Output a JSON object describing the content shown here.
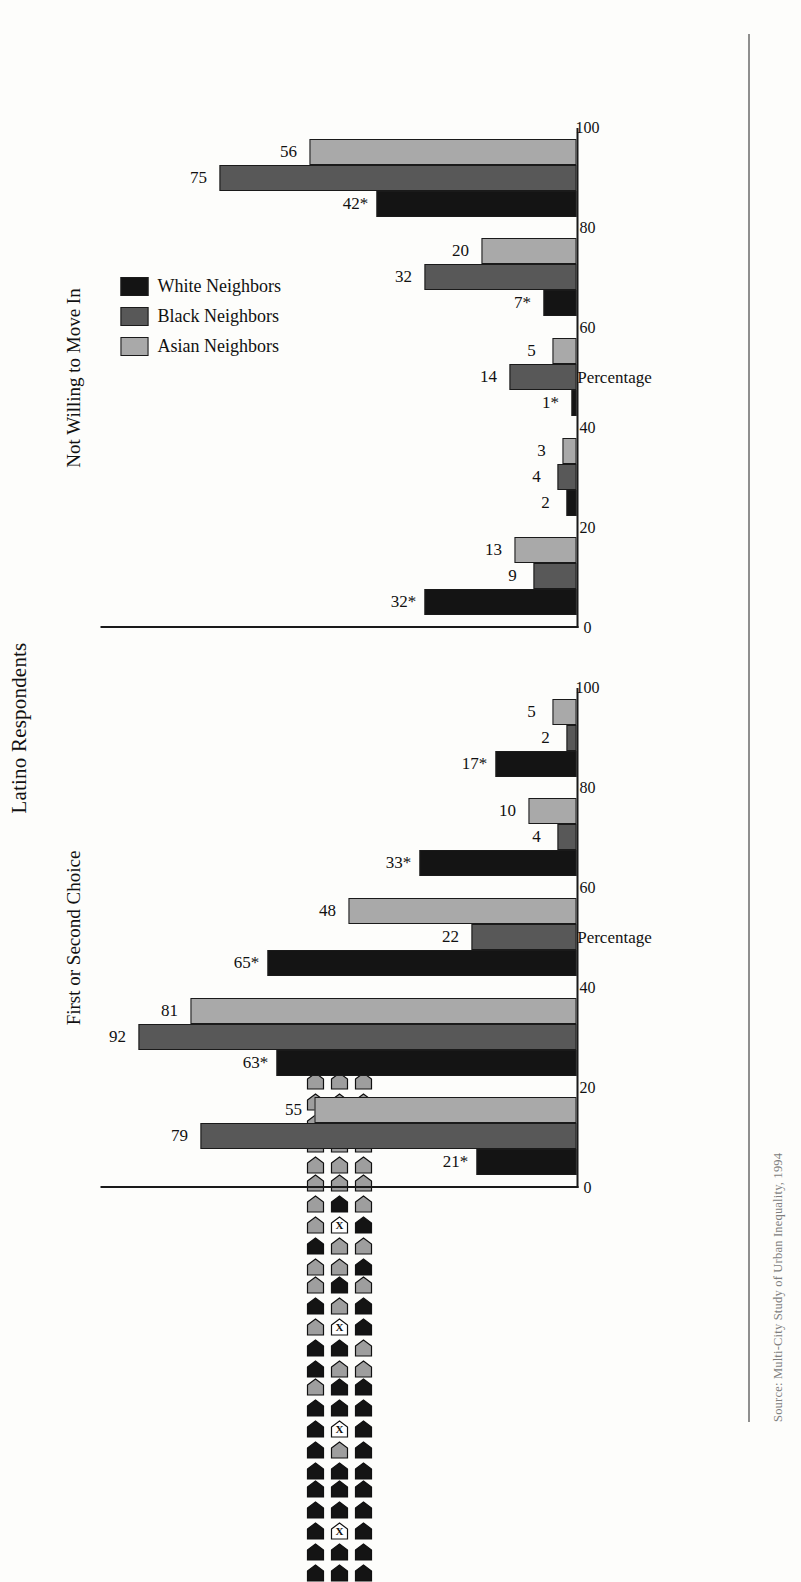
{
  "figure": {
    "title": "Latino Respondents",
    "caption": "Source: Multi-City Study of Urban Inequality, 1994",
    "panels": [
      "First or Second Choice",
      "Not Willing to Move In"
    ],
    "axis_title": "Percentage",
    "footnote_marker": "*"
  },
  "legend": {
    "position": "right",
    "items": [
      {
        "label": "White Neighbors",
        "key": "white-n",
        "color": "#141414"
      },
      {
        "label": "Black Neighbors",
        "key": "black-n",
        "color": "#585858"
      },
      {
        "label": "Asian Neighbors",
        "key": "asian-n",
        "color": "#a9a9a9"
      }
    ]
  },
  "chart_data": {
    "type": "bar",
    "title": "Latino Respondents",
    "xlabel": "Percentage",
    "ylabel": "",
    "xlim": [
      0,
      100
    ],
    "ticks": [
      0,
      20,
      40,
      60,
      80,
      100
    ],
    "grid": false,
    "legend_position": "right",
    "categories": [
      "All-white neighborhood (14 white, respondent)",
      "Mostly white neighborhood (11 white, 3 black, respondent)",
      "Half-and-half neighborhood (7 white, 7 black, respondent)",
      "Mostly black neighborhood (2 white, 12 black, respondent)",
      "All-black neighborhood (14 black, respondent)"
    ],
    "panels": [
      {
        "name": "First or Second Choice",
        "series": [
          {
            "name": "White Neighbors",
            "key": "white-n",
            "values": [
              21,
              63,
              65,
              33,
              17
            ],
            "labels": [
              "21*",
              "63*",
              "65*",
              "33*",
              "17*"
            ]
          },
          {
            "name": "Black Neighbors",
            "key": "black-n",
            "values": [
              79,
              92,
              22,
              4,
              2
            ],
            "labels": [
              "79",
              "92",
              "22",
              "4",
              "2"
            ]
          },
          {
            "name": "Asian Neighbors",
            "key": "asian-n",
            "values": [
              55,
              81,
              48,
              10,
              5
            ],
            "labels": [
              "55",
              "81",
              "48",
              "10",
              "5"
            ]
          }
        ]
      },
      {
        "name": "Not Willing to Move In",
        "series": [
          {
            "name": "White Neighbors",
            "key": "white-n",
            "values": [
              32,
              2,
              1,
              7,
              42
            ],
            "labels": [
              "32*",
              "2",
              "1*",
              "7*",
              "42*"
            ]
          },
          {
            "name": "Black Neighbors",
            "key": "black-n",
            "values": [
              9,
              4,
              14,
              32,
              75
            ],
            "labels": [
              "9",
              "4",
              "14",
              "32",
              "75"
            ]
          },
          {
            "name": "Asian Neighbors",
            "key": "asian-n",
            "values": [
              13,
              3,
              5,
              20,
              56
            ],
            "labels": [
              "13",
              "3",
              "5",
              "20",
              "56"
            ]
          }
        ]
      }
    ],
    "neighborhood_cards": [
      {
        "rows": [
          [
            "w",
            "w",
            "w"
          ],
          [
            "w",
            "w",
            "w"
          ],
          [
            "w",
            "x",
            "w"
          ],
          [
            "w",
            "w",
            "w"
          ],
          [
            "w",
            "w",
            "w"
          ]
        ]
      },
      {
        "rows": [
          [
            "w",
            "w",
            "w"
          ],
          [
            "w",
            "b",
            "w"
          ],
          [
            "w",
            "x",
            "b"
          ],
          [
            "b",
            "w",
            "w"
          ],
          [
            "w",
            "w",
            "b"
          ]
        ]
      },
      {
        "rows": [
          [
            "w",
            "b",
            "w"
          ],
          [
            "b",
            "w",
            "b"
          ],
          [
            "w",
            "x",
            "b"
          ],
          [
            "b",
            "b",
            "w"
          ],
          [
            "b",
            "w",
            "w"
          ]
        ]
      },
      {
        "rows": [
          [
            "w",
            "b",
            "b"
          ],
          [
            "b",
            "b",
            "b"
          ],
          [
            "b",
            "x",
            "b"
          ],
          [
            "b",
            "w",
            "b"
          ],
          [
            "b",
            "b",
            "b"
          ]
        ]
      },
      {
        "rows": [
          [
            "b",
            "b",
            "b"
          ],
          [
            "b",
            "b",
            "b"
          ],
          [
            "b",
            "x",
            "b"
          ],
          [
            "b",
            "b",
            "b"
          ],
          [
            "b",
            "b",
            "b"
          ]
        ]
      }
    ]
  }
}
